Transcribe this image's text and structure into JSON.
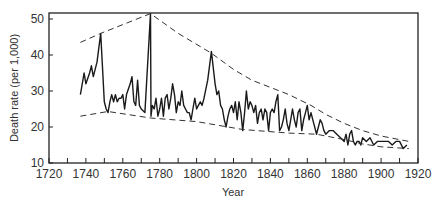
{
  "chart_data": {
    "type": "line",
    "title": "",
    "xlabel": "Year",
    "ylabel": "Death rate (per 1,000)",
    "xlim": [
      1720,
      1920
    ],
    "ylim": [
      10,
      52
    ],
    "xticks": [
      1720,
      1740,
      1760,
      1780,
      1800,
      1820,
      1840,
      1860,
      1880,
      1900,
      1920
    ],
    "xticks_minor": [
      1730,
      1750,
      1770,
      1790,
      1810,
      1830,
      1850,
      1870,
      1890,
      1910
    ],
    "yticks": [
      10,
      20,
      30,
      40,
      50
    ],
    "grid": false,
    "legend": null,
    "series": [
      {
        "name": "Death rate",
        "style": "solid",
        "x": [
          1737,
          1739,
          1740,
          1742,
          1743,
          1744,
          1746,
          1748,
          1750,
          1751,
          1752,
          1753,
          1754,
          1755,
          1756,
          1757,
          1758,
          1759,
          1760,
          1761,
          1762,
          1764,
          1765,
          1766,
          1767,
          1768,
          1769,
          1770,
          1772,
          1775,
          1775.3,
          1776,
          1777,
          1778,
          1779,
          1780,
          1781,
          1782,
          1783,
          1784,
          1785,
          1786,
          1787,
          1788,
          1789,
          1790,
          1791,
          1792,
          1793,
          1794,
          1795,
          1796,
          1797,
          1798,
          1799,
          1800,
          1801,
          1802,
          1803,
          1804,
          1806,
          1808,
          1810,
          1811,
          1812,
          1813,
          1814,
          1815,
          1816,
          1817,
          1818,
          1819,
          1820,
          1821,
          1822,
          1823,
          1824,
          1825,
          1826,
          1827,
          1828,
          1829,
          1830,
          1831,
          1832,
          1833,
          1834,
          1835,
          1836,
          1837,
          1838,
          1839,
          1840,
          1841,
          1842,
          1843,
          1844,
          1845,
          1846,
          1847,
          1848,
          1849,
          1850,
          1852,
          1853,
          1854,
          1855,
          1856,
          1857,
          1858,
          1859,
          1860,
          1861,
          1862,
          1863,
          1864,
          1865,
          1866,
          1867,
          1868,
          1869,
          1870,
          1872,
          1874,
          1876,
          1878,
          1880,
          1881,
          1882,
          1883,
          1884,
          1885,
          1886,
          1887,
          1888,
          1889,
          1890,
          1892,
          1894,
          1896,
          1898,
          1900,
          1902,
          1904,
          1906,
          1908,
          1910,
          1912,
          1914
        ],
        "values": [
          29,
          35,
          32,
          35,
          37,
          34,
          38,
          46,
          27,
          25,
          24,
          27,
          29,
          27,
          29,
          27,
          28,
          28,
          29,
          25,
          29,
          32,
          34,
          27,
          26,
          33,
          26,
          25,
          24,
          51.5,
          23,
          26,
          25,
          28,
          23,
          25,
          28,
          23,
          28,
          29,
          25,
          28,
          32,
          29,
          24,
          27,
          26,
          30,
          26,
          25,
          24,
          24,
          22,
          25,
          28,
          25,
          26,
          27,
          26,
          28,
          33,
          41,
          32,
          29,
          30,
          26,
          25,
          22,
          20,
          23,
          25,
          26,
          24,
          27,
          22,
          27,
          24,
          19,
          24,
          30,
          25,
          27,
          26,
          24,
          26,
          21,
          24,
          25,
          22,
          25,
          24,
          19,
          24,
          25,
          24,
          27,
          29,
          19,
          20,
          22,
          25,
          21,
          19,
          25,
          22,
          20,
          24,
          25,
          19,
          22,
          24,
          26,
          22,
          24,
          22,
          20,
          18,
          20,
          22,
          21,
          19,
          18,
          19,
          19,
          18,
          17,
          16,
          18,
          15,
          18,
          19,
          16,
          15,
          16,
          16,
          15,
          17,
          16,
          17,
          15,
          16,
          16,
          16,
          16,
          15,
          16,
          16,
          14,
          15
        ]
      },
      {
        "name": "Upper envelope",
        "style": "dashed",
        "x": [
          1737,
          1748,
          1775,
          1790,
          1808,
          1820,
          1830,
          1840,
          1850,
          1862,
          1870,
          1880,
          1890,
          1900,
          1910,
          1915
        ],
        "values": [
          43.5,
          46,
          51.5,
          46,
          40.5,
          36,
          33,
          31,
          29,
          26,
          23.5,
          21,
          19,
          17.5,
          16.5,
          16
        ]
      },
      {
        "name": "Lower envelope",
        "style": "dashed",
        "x": [
          1737,
          1752,
          1775,
          1800,
          1825,
          1850,
          1865,
          1880,
          1890,
          1900,
          1915
        ],
        "values": [
          23,
          24.3,
          22.5,
          21.5,
          19.3,
          18.3,
          18,
          16.5,
          15.3,
          14.5,
          14
        ]
      }
    ]
  },
  "axes": {
    "xlabel": "Year",
    "ylabel": "Death rate (per 1,000)"
  }
}
